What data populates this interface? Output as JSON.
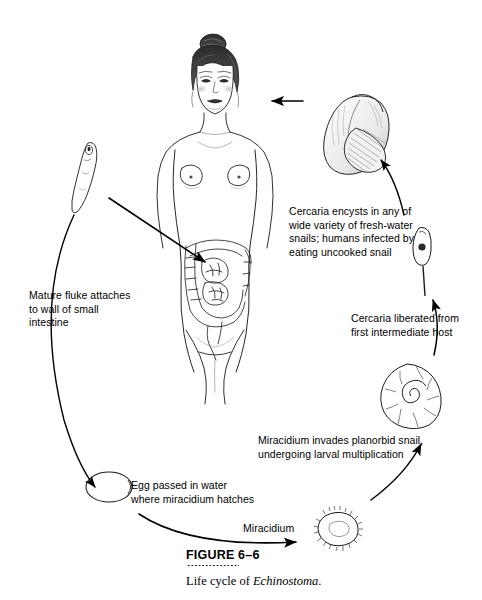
{
  "figure": {
    "number": "FIGURE 6–6",
    "caption_prefix": "Life cycle of ",
    "caption_species": "Echinostoma",
    "caption_suffix": "."
  },
  "labels": {
    "cercaria_encysts": "Cercaria encysts in any of\nwide variety of fresh-water\nsnails; humans infected by\neating uncooked snail",
    "mature_fluke": "Mature fluke attaches\nto wall of small\nintestine",
    "cercaria_liberated": "Cercaria liberated from\nfirst intermediate host",
    "miracidium_invades": "Miracidium invades planorbid snail,\nundergoing larval multiplication",
    "egg_passed": "Egg passed in water\nwhere miracidium hatches",
    "miracidium": "Miracidium"
  },
  "illustrations": {
    "human": "human-female-figure-with-intestines",
    "adult_fluke": "adult-fluke-worm",
    "edible_snail": "conical-fresh-water-snail-shell",
    "cercaria": "cercaria-larva-with-tail",
    "planorbid_snail": "planorbid-spiral-snail",
    "miracidium_larva": "ciliated-miracidium-larva",
    "egg": "operculated-fluke-egg"
  },
  "colors": {
    "ink": "#000000",
    "line": "#1a1a1a",
    "shade_light": "#d9d9d9",
    "shade_mid": "#9a9a9a",
    "shade_dark": "#4a4a4a",
    "background": "#ffffff"
  }
}
